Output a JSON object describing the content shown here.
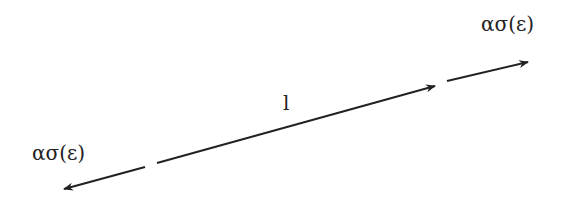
{
  "diagram": {
    "labels": {
      "top_right": "ασ(ε)",
      "left": "ασ(ε)",
      "middle": "l"
    },
    "stroke_color": "#222222",
    "segments": [
      {
        "name": "left-force-arrow",
        "x1": 145,
        "y1": 167,
        "x2": 64,
        "y2": 189
      },
      {
        "name": "member-length-arrow",
        "x1": 157,
        "y1": 163,
        "x2": 435,
        "y2": 86
      },
      {
        "name": "right-force-arrow",
        "x1": 447,
        "y1": 81,
        "x2": 528,
        "y2": 62
      }
    ]
  }
}
